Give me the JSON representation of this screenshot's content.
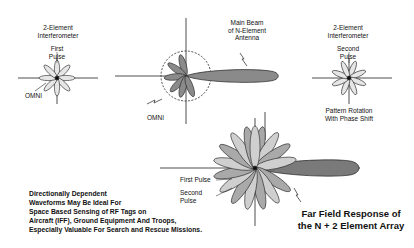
{
  "diagram": {
    "left_pattern": {
      "title_line1": "2-Element",
      "title_line2": "Interferometer",
      "pulse_line1": "First",
      "pulse_line2": "Pulse",
      "omni_label": "OMNI"
    },
    "center_pattern": {
      "beam_line1": "Main Beam",
      "beam_line2": "of N-Element",
      "beam_line3": "Antenna",
      "omni_label": "OMNI"
    },
    "right_pattern": {
      "title_line1": "2-Element",
      "title_line2": "Interferometer",
      "pulse_line1": "Second",
      "pulse_line2": "Pulse",
      "caption_line1": "Pattern Rotation",
      "caption_line2": "With Phase Shift"
    },
    "combined_pattern": {
      "first_pulse_label": "First Pulse",
      "second_pulse_line1": "Second",
      "second_pulse_line2": "Pulse",
      "caption_line1": "Far Field Response of",
      "caption_line2": "the N + 2 Element Array"
    },
    "note": {
      "line1": "Directionally Dependent",
      "line2": "Waveforms May Be Ideal For",
      "line3": "Space Based Sensing of RF Tags on",
      "line4": "Aircraft (IFF), Ground Equipment And Troops,",
      "line5": "Especially Valuable For Search and Rescue Missions."
    },
    "colors": {
      "dark_lobe": "#7a7a7a",
      "light_lobe": "#cfcfcf",
      "mid_lobe": "#a9a9a9",
      "axis": "#222222"
    }
  }
}
